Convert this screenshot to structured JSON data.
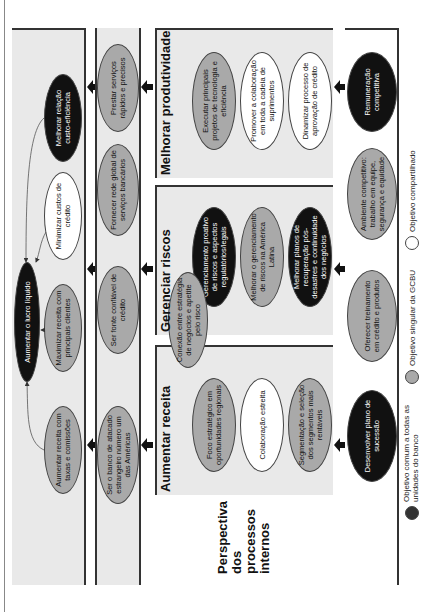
{
  "orientation": "rotated-90-ccw",
  "perspectives": [
    {
      "id": "financeira",
      "label": "Perspectiva\nfinanceira"
    },
    {
      "id": "cliente",
      "label": "Perspectiva\ndo cliente"
    },
    {
      "id": "processos",
      "label": "Perspectiva\ndos\nprocessos\ninternos"
    },
    {
      "id": "capital",
      "label": "Perspectiva\ndo capital\nhumano"
    }
  ],
  "financial": {
    "objectives": [
      {
        "text": "Aumentar receita com taxas e comissões",
        "type": "gray"
      },
      {
        "text": "Maximizar receita com principais clientes",
        "type": "gray"
      },
      {
        "text": "Aumentar o lucro líquido",
        "type": "black"
      },
      {
        "text": "Minimizar custos de crédito",
        "type": "white"
      },
      {
        "text": "Melhorar relação custo-eficiência",
        "type": "black"
      }
    ]
  },
  "client": {
    "objectives": [
      {
        "text": "Ser o banco de atacado estrangeiro número um das Américas",
        "type": "gray"
      },
      {
        "text": "Ser fonte confiável de crédito",
        "type": "gray"
      },
      {
        "text": "Fornecer rede global de serviços bancários",
        "type": "gray"
      },
      {
        "text": "Prestar serviços rápidos e precisos",
        "type": "gray"
      }
    ]
  },
  "processes": {
    "sections": [
      {
        "title": "Aumentar receita",
        "objectives": [
          {
            "text": "Foco estratégico em oportunidades regionais",
            "type": "gray"
          },
          {
            "text": "Colaboração estreita",
            "type": "white"
          },
          {
            "text": "Segmentação e seleção dos segmentos mais rentáveis",
            "type": "gray"
          }
        ]
      },
      {
        "title": "Gerenciar riscos",
        "objectives": [
          {
            "text": "Conexão entre estratégia de negócios e apetite pelo risco",
            "type": "gray"
          },
          {
            "text": "Gerenciamento proativo de riscos e aspectos regulatórios/legais",
            "type": "black"
          },
          {
            "text": "Melhorar o gerenciamento de riscos na América Latina",
            "type": "gray"
          },
          {
            "text": "Melhorar planos de recuperação pós-desastres e continuidade dos negócios",
            "type": "black"
          }
        ]
      },
      {
        "title": "Melhorar produtividade",
        "objectives": [
          {
            "text": "Executar principais projetos de tecnologia e eficiência",
            "type": "gray"
          },
          {
            "text": "Promover a colaboração em toda a cadeia de suprimentos",
            "type": "white"
          },
          {
            "text": "Dinamizar processo de aprovação de crédito",
            "type": "white"
          }
        ]
      }
    ]
  },
  "human_capital": {
    "objectives": [
      {
        "text": "Desenvolver plano de sucessão",
        "type": "black"
      },
      {
        "text": "Oferecer treinamento em crédito e produtos",
        "type": "gray"
      },
      {
        "text": "Ambiente competitivo: trabalho em equipe, segurança e equidade",
        "type": "gray"
      },
      {
        "text": "Remuneração competitiva",
        "type": "black"
      }
    ]
  },
  "legend": [
    {
      "type": "black",
      "text": "Objetivo comum a todas as unidades do banco"
    },
    {
      "type": "gray",
      "text": "Objetivo singular da GCBU"
    },
    {
      "type": "white",
      "text": "Objetivo compartilhado"
    }
  ],
  "colors": {
    "black": "#111111",
    "gray": "#a9a9a9",
    "white": "#ffffff",
    "panel": "#e9e9e9"
  }
}
